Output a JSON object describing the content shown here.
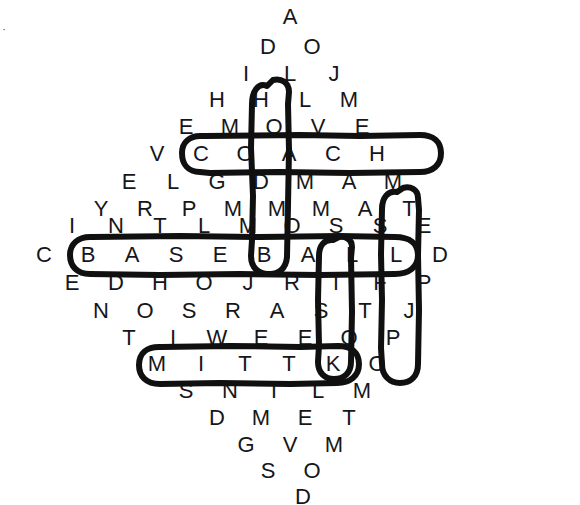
{
  "puzzle": {
    "title": "Baseball Word Search",
    "type": "word-search",
    "background_color": "#ffffff",
    "letter_color": "#16161a",
    "circle_color": "#101010",
    "layout": "diamond",
    "col_pitch": 44,
    "row_pitch": 35.5,
    "origin_x": 290,
    "origin_y": 17,
    "rows": [
      {
        "index": 0,
        "y": 17,
        "letters": [
          "A"
        ],
        "start_x": 290
      },
      {
        "index": 1,
        "y": 46.5,
        "letters": [
          "D",
          "O"
        ],
        "start_x": 268
      },
      {
        "index": 2,
        "y": 74,
        "letters": [
          "I",
          "L",
          "J"
        ],
        "start_x": 246
      },
      {
        "index": 3,
        "y": 100,
        "letters": [
          "H",
          "H",
          "L",
          "M"
        ],
        "start_x": 217
      },
      {
        "index": 4,
        "y": 127,
        "letters": [
          "E",
          "M",
          "O",
          "V",
          "E"
        ],
        "start_x": 186
      },
      {
        "index": 5,
        "y": 154,
        "letters": [
          "V",
          "C",
          "O",
          "A",
          "C",
          "H"
        ],
        "start_x": 157
      },
      {
        "index": 6,
        "y": 182,
        "letters": [
          "E",
          "L",
          "G",
          "D",
          "M",
          "A",
          "M"
        ],
        "start_x": 129
      },
      {
        "index": 7,
        "y": 209,
        "letters": [
          "Y",
          "R",
          "P",
          "M",
          "M",
          "M",
          "A",
          "T"
        ],
        "start_x": 101
      },
      {
        "index": 8,
        "y": 226,
        "letters": [
          "I",
          "N",
          "T",
          "L",
          "M",
          "O",
          "S",
          "S",
          "E"
        ],
        "start_x": 72
      },
      {
        "index": 9,
        "y": 255,
        "letters": [
          "C",
          "B",
          "A",
          "S",
          "E",
          "B",
          "A",
          "L",
          "L",
          "D"
        ],
        "start_x": 44
      },
      {
        "index": 10,
        "y": 283,
        "letters": [
          "E",
          "D",
          "H",
          "O",
          "J",
          "R",
          "T",
          "F",
          "P"
        ],
        "start_x": 72
      },
      {
        "index": 11,
        "y": 311,
        "letters": [
          "N",
          "O",
          "S",
          "R",
          "A",
          "S",
          "T",
          "J"
        ],
        "start_x": 101
      },
      {
        "index": 12,
        "y": 338,
        "letters": [
          "T",
          "I",
          "W",
          "E",
          "E",
          "O",
          "P"
        ],
        "start_x": 129
      },
      {
        "index": 13,
        "y": 364,
        "letters": [
          "M",
          "I",
          "T",
          "T",
          "K",
          "O"
        ],
        "start_x": 157
      },
      {
        "index": 14,
        "y": 391,
        "letters": [
          "S",
          "N",
          "T",
          "L",
          "M"
        ],
        "start_x": 186
      },
      {
        "index": 15,
        "y": 418,
        "letters": [
          "D",
          "M",
          "E",
          "T"
        ],
        "start_x": 217
      },
      {
        "index": 16,
        "y": 445,
        "letters": [
          "G",
          "V",
          "M"
        ],
        "start_x": 246
      },
      {
        "index": 17,
        "y": 471,
        "letters": [
          "S",
          "O"
        ],
        "start_x": 268
      },
      {
        "index": 18,
        "y": 497,
        "letters": [
          "D"
        ],
        "start_x": 303
      }
    ],
    "found_words": [
      {
        "word": "COACH",
        "orientation": "horizontal",
        "row": 5,
        "start_col": 1,
        "length": 5
      },
      {
        "word": "HOME",
        "orientation": "vertical",
        "col_x": 278,
        "start_row": 3,
        "length": 4
      },
      {
        "word": "BASEBALL",
        "orientation": "horizontal",
        "row": 9,
        "start_col": 1,
        "length": 8
      },
      {
        "word": "MASK",
        "orientation": "vertical",
        "col_x": 407,
        "start_row": 7,
        "length": 4
      },
      {
        "word": "BAT",
        "orientation": "vertical",
        "col_x": 341,
        "start_row": 9,
        "length": 3
      },
      {
        "word": "MITT",
        "orientation": "horizontal",
        "row": 13,
        "start_col": 0,
        "length": 4
      }
    ],
    "stray_marks": [
      {
        "name": "corner-speck",
        "x": 4,
        "y": 29,
        "glyph": "·"
      }
    ]
  }
}
